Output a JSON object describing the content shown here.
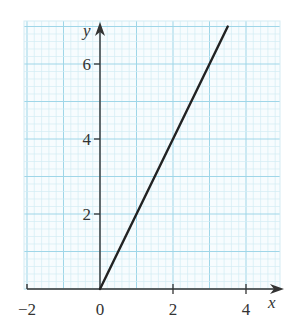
{
  "chart_data": {
    "type": "line",
    "title": "",
    "xlabel": "x",
    "ylabel": "y",
    "xlim": [
      -2.1,
      4.9
    ],
    "ylim": [
      0,
      7.1
    ],
    "grid": true,
    "grid_style": "graph paper: major lines every 1 unit, minor lines every 0.2 units",
    "x_ticks": [
      -2,
      0,
      2,
      4
    ],
    "x_tick_labels": [
      "−2",
      "0",
      "2",
      "4"
    ],
    "y_ticks": [
      2,
      4,
      6
    ],
    "y_tick_labels": [
      "2",
      "4",
      "6"
    ],
    "series": [
      {
        "name": "y = 2x",
        "x": [
          0,
          3.5
        ],
        "y": [
          0,
          7
        ],
        "color": "#222222"
      }
    ],
    "legend": null
  },
  "colors": {
    "grid_minor": "#d3ecf4",
    "grid_major": "#9fd6e8",
    "axis": "#333333",
    "line": "#222222",
    "background": "#ffffff"
  }
}
